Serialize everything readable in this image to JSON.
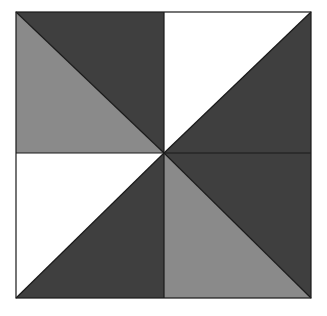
{
  "figure": {
    "bounds": {
      "x": 16,
      "y": 12,
      "width": 295,
      "height": 286
    },
    "center": {
      "x": 164,
      "y": 153
    },
    "colors": {
      "dark": "#3f3f3f",
      "medium": "#8a8a8a",
      "light": "#ffffff",
      "outline": "#1a1a1a"
    },
    "quadrants": [
      {
        "name": "top-left",
        "diagonal": "top-left to bottom-right",
        "upper_triangle": "dark",
        "lower_triangle": "medium"
      },
      {
        "name": "top-right",
        "diagonal": "bottom-left to top-right",
        "upper_triangle": "light",
        "lower_triangle": "dark"
      },
      {
        "name": "bottom-left",
        "diagonal": "bottom-left to top-right",
        "upper_triangle": "light",
        "lower_triangle": "dark"
      },
      {
        "name": "bottom-right",
        "diagonal": "top-left to bottom-right",
        "upper_triangle": "dark",
        "lower_triangle": "medium"
      }
    ]
  }
}
